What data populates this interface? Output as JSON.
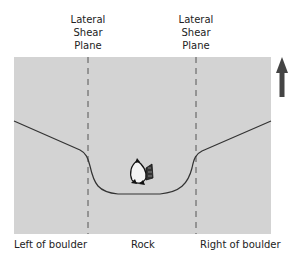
{
  "diagram": {
    "top_labels": [
      {
        "lines": [
          "Lateral",
          "Shear",
          "Plane"
        ]
      },
      {
        "lines": [
          "Lateral",
          "Shear",
          "Plane"
        ]
      }
    ],
    "bottom_labels": {
      "left": "Left of boulder",
      "center": "Rock",
      "right": "Right of boulder"
    },
    "icons": {
      "flow_arrow": "arrow-up-icon",
      "fish": "fish-icon"
    },
    "colors": {
      "panel_bg": "#d3d3d3",
      "line": "#333333",
      "dash": "#555555",
      "arrow": "#444444"
    }
  }
}
